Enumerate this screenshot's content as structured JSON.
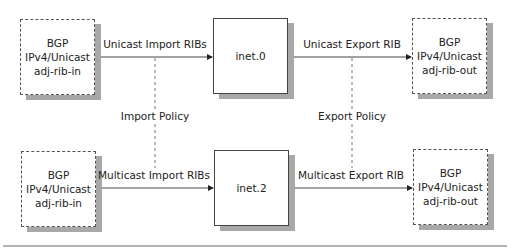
{
  "diagram": {
    "top_row": {
      "source_box": {
        "lines": [
          "BGP",
          "IPv4/Unicast",
          "adj-rib-in"
        ]
      },
      "import_label": "Unicast Import RIBs",
      "table_box": {
        "label": "inet.0"
      },
      "export_label": "Unicast Export RIB",
      "dest_box": {
        "lines": [
          "BGP",
          "IPv4/Unicast",
          "adj-rib-out"
        ]
      }
    },
    "bottom_row": {
      "source_box": {
        "lines": [
          "BGP",
          "IPv4/Unicast",
          "adj-rib-in"
        ]
      },
      "import_label": "Multicast Import RIBs",
      "table_box": {
        "label": "inet.2"
      },
      "export_label": "Multicast Export RIB",
      "dest_box": {
        "lines": [
          "BGP",
          "IPv4/Unicast",
          "adj-rib-out"
        ]
      }
    },
    "policies": {
      "import": "Import Policy",
      "export": "Export Policy"
    },
    "colors": {
      "shadow": "#a8a8a8",
      "line": "#444444",
      "rule": "#999999"
    }
  }
}
